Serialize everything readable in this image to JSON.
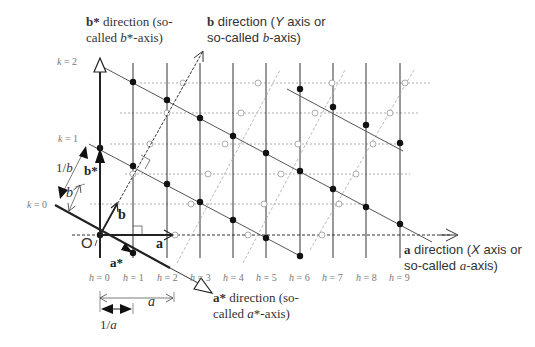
{
  "diagram": {
    "labels": {
      "bstar_direction": {
        "line1_bold": "b*",
        "line1_rest": " direction (so-",
        "line2_pre": "called ",
        "line2_it": "b",
        "line2_post": "*-axis)"
      },
      "b_direction": {
        "line1_bold": "b",
        "line1_rest": " direction (",
        "line1_it": "Y",
        "line1_post": " axis or",
        "line2_pre": "so-called ",
        "line2_it": "b",
        "line2_post": "-axis)"
      },
      "a_direction": {
        "line1_bold": "a",
        "line1_rest": " direction (",
        "line1_it": "X",
        "line1_post": " axis or",
        "line2_pre": "so-called ",
        "line2_it": "a",
        "line2_post": "-axis)"
      },
      "astar_direction": {
        "line1_bold": "a*",
        "line1_rest": " direction (so-",
        "line2_pre": "called ",
        "line2_it": "a",
        "line2_post": "*-axis)"
      },
      "origin": "O",
      "vector_a": "a",
      "vector_b": "b",
      "vector_astar": "a*",
      "vector_bstar": "b*",
      "dim_a": "a",
      "dim_one_over_a": "1/a",
      "dim_b": "b",
      "dim_one_over_b": "1/b"
    },
    "k_labels": [
      {
        "var": "k",
        "eq": " = 2"
      },
      {
        "var": "k",
        "eq": " = 1"
      },
      {
        "var": "k",
        "eq": " = 0"
      }
    ],
    "h_labels": [
      {
        "var": "h",
        "eq": " = 0"
      },
      {
        "var": "h",
        "eq": " = 1"
      },
      {
        "var": "h",
        "eq": " = 2"
      },
      {
        "var": "h",
        "eq": " = 3"
      },
      {
        "var": "h",
        "eq": " = 4"
      },
      {
        "var": "h",
        "eq": " = 5"
      },
      {
        "var": "h",
        "eq": " = 6"
      },
      {
        "var": "h",
        "eq": " = 7"
      },
      {
        "var": "h",
        "eq": " = 8"
      },
      {
        "var": "h",
        "eq": " = 9"
      }
    ],
    "colors": {
      "line": "#333333",
      "dotted": "#999999",
      "grey_line": "#aaaaaa",
      "dot": "#111111",
      "text": "#333333",
      "index_text": "#777777"
    }
  }
}
